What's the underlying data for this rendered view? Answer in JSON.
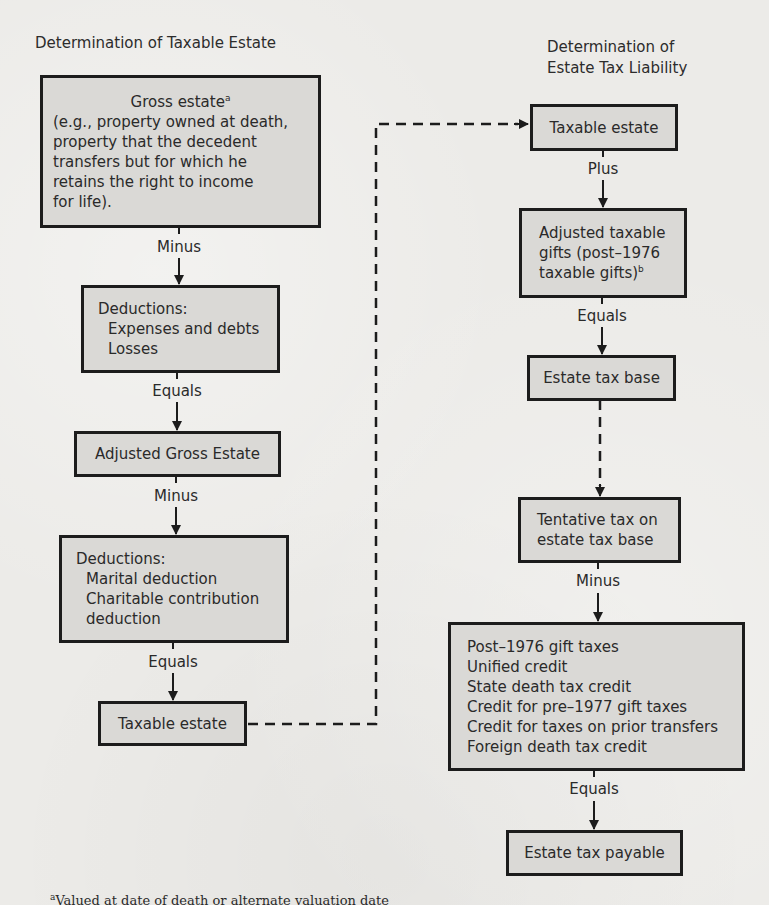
{
  "left_column": {
    "title": "Determination of Taxable Estate",
    "boxes": [
      {
        "id": "gross-estate",
        "heading": "Gross estate",
        "heading_footnote_marker": "a",
        "lines": [
          "(e.g., property owned at death,",
          "property that the decedent",
          "transfers but for which he",
          "retains the right to income",
          "for life)."
        ]
      },
      {
        "id": "deductions-1",
        "heading": "Deductions:",
        "lines": [
          "Expenses and debts",
          "Losses"
        ]
      },
      {
        "id": "adjusted-gross-estate",
        "heading": "Adjusted Gross Estate"
      },
      {
        "id": "deductions-2",
        "heading": "Deductions:",
        "lines": [
          "Marital deduction",
          "Charitable contribution",
          "deduction"
        ]
      },
      {
        "id": "taxable-estate-left",
        "heading": "Taxable estate"
      }
    ],
    "operators": [
      "Minus",
      "Equals",
      "Minus",
      "Equals"
    ]
  },
  "right_column": {
    "title": "Determination of\nEstate Tax Liability",
    "boxes": [
      {
        "id": "taxable-estate-right",
        "heading": "Taxable estate"
      },
      {
        "id": "adjusted-taxable-gifts",
        "lines": [
          "Adjusted taxable",
          "gifts (post–1976",
          "taxable gifts)"
        ],
        "footnote_marker": "b"
      },
      {
        "id": "estate-tax-base",
        "heading": "Estate tax base"
      },
      {
        "id": "tentative-tax",
        "lines": [
          "Tentative tax on",
          "estate tax base"
        ]
      },
      {
        "id": "credits",
        "lines": [
          "Post–1976 gift taxes",
          "Unified credit",
          "State death tax credit",
          "Credit for pre–1977 gift taxes",
          "Credit for taxes on prior transfers",
          "Foreign death tax credit"
        ]
      },
      {
        "id": "estate-tax-payable",
        "heading": "Estate tax payable"
      }
    ],
    "operators": [
      "Plus",
      "Equals",
      "Minus",
      "Equals"
    ]
  },
  "footnote": {
    "marker": "a",
    "text": "Valued at date of death or alternate valuation date"
  },
  "colors": {
    "background": "#ecebe8",
    "box_fill": "#dad9d6",
    "box_border": "#1c1c1c",
    "text": "#2a2a2a",
    "line": "#1c1c1c"
  }
}
